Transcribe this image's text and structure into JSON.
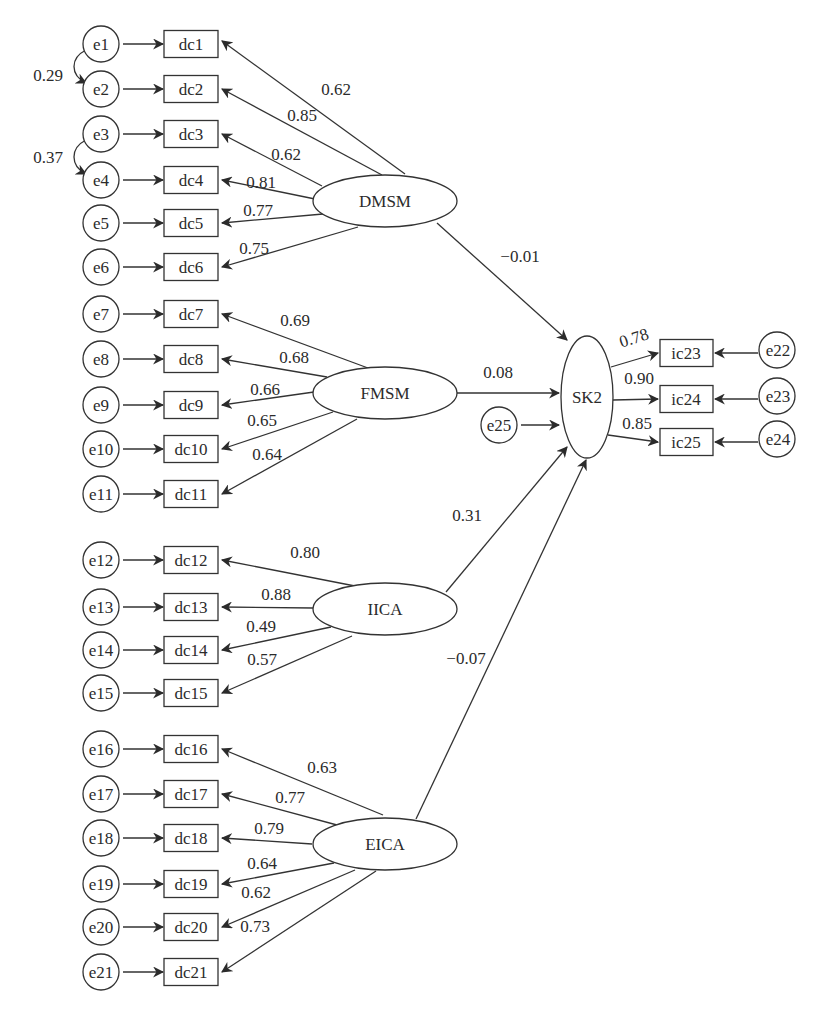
{
  "diagram": {
    "type": "structural-equation-model",
    "latent_factors": [
      {
        "id": "DMSM",
        "label": "DMSM"
      },
      {
        "id": "FMSM",
        "label": "FMSM"
      },
      {
        "id": "IICA",
        "label": "IICA"
      },
      {
        "id": "EICA",
        "label": "EICA"
      },
      {
        "id": "SK2",
        "label": "SK2"
      }
    ],
    "indicators": [
      {
        "label": "dc1",
        "error": "e1",
        "factor": "DMSM",
        "loading": "0.62"
      },
      {
        "label": "dc2",
        "error": "e2",
        "factor": "DMSM",
        "loading": "0.85"
      },
      {
        "label": "dc3",
        "error": "e3",
        "factor": "DMSM",
        "loading": "0.62"
      },
      {
        "label": "dc4",
        "error": "e4",
        "factor": "DMSM",
        "loading": "0.81"
      },
      {
        "label": "dc5",
        "error": "e5",
        "factor": "DMSM",
        "loading": "0.77"
      },
      {
        "label": "dc6",
        "error": "e6",
        "factor": "DMSM",
        "loading": "0.75"
      },
      {
        "label": "dc7",
        "error": "e7",
        "factor": "FMSM",
        "loading": "0.69"
      },
      {
        "label": "dc8",
        "error": "e8",
        "factor": "FMSM",
        "loading": "0.68"
      },
      {
        "label": "dc9",
        "error": "e9",
        "factor": "FMSM",
        "loading": "0.66"
      },
      {
        "label": "dc10",
        "error": "e10",
        "factor": "FMSM",
        "loading": "0.65"
      },
      {
        "label": "dc11",
        "error": "e11",
        "factor": "FMSM",
        "loading": "0.64"
      },
      {
        "label": "dc12",
        "error": "e12",
        "factor": "IICA",
        "loading": "0.80"
      },
      {
        "label": "dc13",
        "error": "e13",
        "factor": "IICA",
        "loading": "0.88"
      },
      {
        "label": "dc14",
        "error": "e14",
        "factor": "IICA",
        "loading": "0.49"
      },
      {
        "label": "dc15",
        "error": "e15",
        "factor": "IICA",
        "loading": "0.57"
      },
      {
        "label": "dc16",
        "error": "e16",
        "factor": "EICA",
        "loading": "0.63"
      },
      {
        "label": "dc17",
        "error": "e17",
        "factor": "EICA",
        "loading": "0.77"
      },
      {
        "label": "dc18",
        "error": "e18",
        "factor": "EICA",
        "loading": "0.79"
      },
      {
        "label": "dc19",
        "error": "e19",
        "factor": "EICA",
        "loading": "0.64"
      },
      {
        "label": "dc20",
        "error": "e20",
        "factor": "EICA",
        "loading": "0.62"
      },
      {
        "label": "dc21",
        "error": "e21",
        "factor": "EICA",
        "loading": "0.73"
      }
    ],
    "outcome_indicators": [
      {
        "label": "ic23",
        "error": "e22",
        "factor": "SK2",
        "loading": "0.78"
      },
      {
        "label": "ic24",
        "error": "e23",
        "factor": "SK2",
        "loading": "0.90"
      },
      {
        "label": "ic25",
        "error": "e24",
        "factor": "SK2",
        "loading": "0.85"
      }
    ],
    "structural_paths": [
      {
        "from": "DMSM",
        "to": "SK2",
        "coef": "−0.01"
      },
      {
        "from": "FMSM",
        "to": "SK2",
        "coef": "0.08"
      },
      {
        "from": "IICA",
        "to": "SK2",
        "coef": "0.31"
      },
      {
        "from": "EICA",
        "to": "SK2",
        "coef": "−0.07"
      }
    ],
    "disturbance": {
      "label": "e25",
      "to": "SK2"
    },
    "covariances": [
      {
        "between": [
          "e1",
          "e2"
        ],
        "value": "0.29"
      },
      {
        "between": [
          "e3",
          "e4"
        ],
        "value": "0.37"
      }
    ]
  }
}
